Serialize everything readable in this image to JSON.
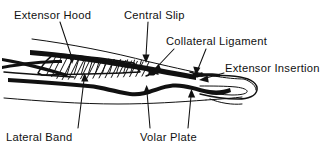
{
  "figure": {
    "background_color": "#ffffff",
    "ink_color": "#111111",
    "width": 335,
    "height": 147
  },
  "labels": {
    "extensor_hood": "Extensor Hood",
    "central_slip": "Central Slip",
    "collateral_ligament": "Collateral Ligament",
    "extensor_insertion": "Extensor Insertion",
    "lateral_band": "Lateral Band",
    "volar_plate": "Volar Plate"
  },
  "label_positions": [
    {
      "key": "extensor_hood",
      "x": 14,
      "y": 18,
      "anchor": "start"
    },
    {
      "key": "central_slip",
      "x": 124,
      "y": 18,
      "anchor": "start"
    },
    {
      "key": "collateral_ligament",
      "x": 166,
      "y": 44,
      "anchor": "start"
    },
    {
      "key": "extensor_insertion",
      "x": 224,
      "y": 71,
      "anchor": "start"
    },
    {
      "key": "lateral_band",
      "x": 6,
      "y": 140,
      "anchor": "start"
    },
    {
      "key": "volar_plate",
      "x": 140,
      "y": 140,
      "anchor": "start"
    }
  ],
  "leaders": [
    {
      "key": "extensor-hood-leader",
      "from": [
        60,
        22
      ],
      "to": [
        72,
        60
      ],
      "arrow": true
    },
    {
      "key": "central-slip-leader",
      "from": [
        148,
        22
      ],
      "to": [
        146,
        58
      ],
      "arrow": true
    },
    {
      "key": "collateral-ligament-leader-1",
      "from": [
        172,
        48
      ],
      "to": [
        152,
        70
      ],
      "arrow": true
    },
    {
      "key": "collateral-ligament-leader-2",
      "from": [
        204,
        48
      ],
      "to": [
        196,
        72
      ],
      "arrow": true
    },
    {
      "key": "extensor-insertion-leader",
      "from": [
        222,
        74
      ],
      "to": [
        198,
        79
      ],
      "arrow": true
    },
    {
      "key": "lateral-band-leader",
      "from": [
        78,
        131
      ],
      "to": [
        84,
        76
      ],
      "arrow": true
    },
    {
      "key": "volar-plate-leader-1",
      "from": [
        150,
        131
      ],
      "to": [
        147,
        88
      ],
      "arrow": true
    },
    {
      "key": "volar-plate-leader-2",
      "from": [
        188,
        131
      ],
      "to": [
        191,
        92
      ],
      "arrow": true
    }
  ],
  "structures": [
    {
      "name": "extensor-hood-hatching",
      "description": "cross-hatched triangular aponeurosis over proximal phalanx"
    },
    {
      "name": "extensor-tendon-band",
      "description": "thick dark dorsal extensor tendon running distally"
    },
    {
      "name": "lateral-band-lines",
      "description": "paired oblique bands crossing proximally"
    },
    {
      "name": "volar-plate-contour",
      "description": "undulating palmar soft-tissue outline"
    },
    {
      "name": "fingertip-outline",
      "description": "distal phalanx and pulp contour at right"
    },
    {
      "name": "skin-outline-dorsal",
      "description": "upper dorsal skin contour line"
    },
    {
      "name": "skin-outline-palmar",
      "description": "lower palmar skin contour line"
    }
  ]
}
